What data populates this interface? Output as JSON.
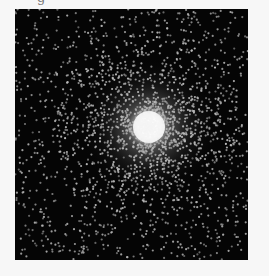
{
  "figure": {
    "caption_fragment": "g",
    "image": {
      "subject": "star-cluster",
      "description": "Simulated globular star cluster: dense bright core with radially thinning field of point-like stars on black background",
      "background_color": "#050505",
      "star_color": "#b8b8b8",
      "core_color": "#ffffff",
      "core_center": [
        134,
        118
      ],
      "core_radius": 16,
      "halo_radius": 70,
      "field_star_count": 1100,
      "cluster_star_count": 1500,
      "star_radius": 1.1
    }
  }
}
